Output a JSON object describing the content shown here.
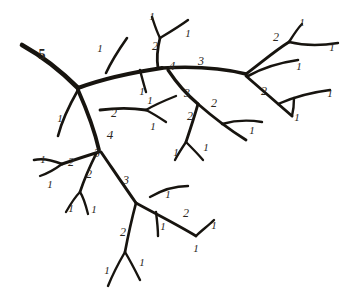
{
  "figure": {
    "kind": "branching-network",
    "background_color": "#ffffff",
    "stroke_color": "#17140f",
    "label_color": "#2a2520",
    "width": 348,
    "height": 292
  },
  "chart_data": {
    "type": "diagram",
    "title": "",
    "xlabel": "",
    "ylabel": "",
    "order_labels": [
      {
        "id": "lbl-5-trunk",
        "text": "5",
        "x": 42,
        "y": 55,
        "size": "s5"
      },
      {
        "id": "lbl-1-a",
        "text": "1",
        "x": 100,
        "y": 48,
        "size": "s2"
      },
      {
        "id": "lbl-1-b",
        "text": "1",
        "x": 152,
        "y": 16,
        "size": "s2"
      },
      {
        "id": "lbl-1-c",
        "text": "1",
        "x": 188,
        "y": 33,
        "size": "s2"
      },
      {
        "id": "lbl-2-a",
        "text": "2",
        "x": 155,
        "y": 46,
        "size": "s3"
      },
      {
        "id": "lbl-4-a",
        "text": "4",
        "x": 172,
        "y": 65,
        "size": "s4"
      },
      {
        "id": "lbl-3-a",
        "text": "3",
        "x": 201,
        "y": 61,
        "size": "s3"
      },
      {
        "id": "lbl-1-d",
        "text": "1",
        "x": 142,
        "y": 91,
        "size": "s2"
      },
      {
        "id": "lbl-1-e",
        "text": "1",
        "x": 302,
        "y": 22,
        "size": "s2"
      },
      {
        "id": "lbl-2-b",
        "text": "2",
        "x": 276,
        "y": 37,
        "size": "s3"
      },
      {
        "id": "lbl-1-f",
        "text": "1",
        "x": 332,
        "y": 47,
        "size": "s2"
      },
      {
        "id": "lbl-1-g",
        "text": "1",
        "x": 299,
        "y": 66,
        "size": "s2"
      },
      {
        "id": "lbl-2-c",
        "text": "2",
        "x": 264,
        "y": 91,
        "size": "s3"
      },
      {
        "id": "lbl-1-h",
        "text": "1",
        "x": 330,
        "y": 93,
        "size": "s2"
      },
      {
        "id": "lbl-1-i",
        "text": "1",
        "x": 297,
        "y": 117,
        "size": "s2"
      },
      {
        "id": "lbl-3-b",
        "text": "3",
        "x": 187,
        "y": 93,
        "size": "s3"
      },
      {
        "id": "lbl-2-d",
        "text": "2",
        "x": 214,
        "y": 103,
        "size": "s3"
      },
      {
        "id": "lbl-1-j",
        "text": "1",
        "x": 252,
        "y": 130,
        "size": "s2"
      },
      {
        "id": "lbl-2-e",
        "text": "2",
        "x": 190,
        "y": 116,
        "size": "s3"
      },
      {
        "id": "lbl-1-k",
        "text": "1",
        "x": 206,
        "y": 147,
        "size": "s2"
      },
      {
        "id": "lbl-1-l",
        "text": "1",
        "x": 176,
        "y": 152,
        "size": "s2"
      },
      {
        "id": "lbl-1-m",
        "text": "1",
        "x": 60,
        "y": 118,
        "size": "s2"
      },
      {
        "id": "lbl-2-f",
        "text": "2",
        "x": 114,
        "y": 113,
        "size": "s3"
      },
      {
        "id": "lbl-4-b",
        "text": "4",
        "x": 110,
        "y": 134,
        "size": "s4"
      },
      {
        "id": "lbl-1-n",
        "text": "1",
        "x": 150,
        "y": 100,
        "size": "s2"
      },
      {
        "id": "lbl-1-o",
        "text": "1",
        "x": 153,
        "y": 126,
        "size": "s2"
      },
      {
        "id": "lbl-3-c",
        "text": "3",
        "x": 97,
        "y": 153,
        "size": "s3"
      },
      {
        "id": "lbl-2-g",
        "text": "2",
        "x": 71,
        "y": 162,
        "size": "s3"
      },
      {
        "id": "lbl-1-p",
        "text": "1",
        "x": 43,
        "y": 159,
        "size": "s2"
      },
      {
        "id": "lbl-1-q",
        "text": "1",
        "x": 50,
        "y": 184,
        "size": "s2"
      },
      {
        "id": "lbl-2-h",
        "text": "2",
        "x": 89,
        "y": 174,
        "size": "s3"
      },
      {
        "id": "lbl-1-r",
        "text": "1",
        "x": 71,
        "y": 208,
        "size": "s2"
      },
      {
        "id": "lbl-1-s",
        "text": "1",
        "x": 94,
        "y": 209,
        "size": "s2"
      },
      {
        "id": "lbl-3-d",
        "text": "3",
        "x": 126,
        "y": 180,
        "size": "s3"
      },
      {
        "id": "lbl-1-t",
        "text": "1",
        "x": 168,
        "y": 194,
        "size": "s2"
      },
      {
        "id": "lbl-2-i",
        "text": "2",
        "x": 186,
        "y": 213,
        "size": "s3"
      },
      {
        "id": "lbl-1-u",
        "text": "1",
        "x": 163,
        "y": 226,
        "size": "s2"
      },
      {
        "id": "lbl-1-v",
        "text": "1",
        "x": 214,
        "y": 225,
        "size": "s2"
      },
      {
        "id": "lbl-1-w",
        "text": "1",
        "x": 196,
        "y": 248,
        "size": "s2"
      },
      {
        "id": "lbl-2-j",
        "text": "2",
        "x": 123,
        "y": 232,
        "size": "s3"
      },
      {
        "id": "lbl-1-x",
        "text": "1",
        "x": 107,
        "y": 270,
        "size": "s2"
      },
      {
        "id": "lbl-1-y",
        "text": "1",
        "x": 142,
        "y": 262,
        "size": "s2"
      }
    ],
    "segments": [
      {
        "id": "seg-trunk-5",
        "order": 5,
        "width": 4.6,
        "d": "M22,45 C40,55 60,70 78,88"
      },
      {
        "id": "seg-main-4-right",
        "order": 4,
        "width": 4.0,
        "d": "M78,88 C105,78 135,72 162,68"
      },
      {
        "id": "seg-4-to-3",
        "order": 3,
        "width": 3.4,
        "d": "M162,68 C195,66 222,68 246,74"
      },
      {
        "id": "seg-node2-stem",
        "order": 2,
        "width": 2.8,
        "d": "M158,68 C156,56 158,46 160,38"
      },
      {
        "id": "seg-2a-tipL",
        "order": 1,
        "width": 2.4,
        "d": "M160,38 C156,30 154,23 152,17"
      },
      {
        "id": "seg-2a-tipR",
        "order": 1,
        "width": 2.4,
        "d": "M160,38 C170,32 180,26 188,20"
      },
      {
        "id": "seg-1-up-left",
        "order": 1,
        "width": 2.6,
        "d": "M106,73 C112,60 120,48 127,38"
      },
      {
        "id": "seg-1-down-mid",
        "order": 1,
        "width": 2.4,
        "d": "M140,70 C142,78 144,85 146,92"
      },
      {
        "id": "seg-r-2-stem",
        "order": 2,
        "width": 2.9,
        "d": "M246,74 C262,62 276,50 289,42"
      },
      {
        "id": "seg-r-2-tip",
        "order": 1,
        "width": 2.4,
        "d": "M289,42 C294,34 298,28 302,24"
      },
      {
        "id": "seg-r-2-curve",
        "order": 1,
        "width": 2.4,
        "d": "M289,42 C305,46 320,46 338,43"
      },
      {
        "id": "seg-r-lower1",
        "order": 1,
        "width": 2.6,
        "d": "M248,76 C266,66 284,62 298,60"
      },
      {
        "id": "seg-r-2c-stem",
        "order": 2,
        "width": 2.9,
        "d": "M246,76 C262,90 278,104 292,116"
      },
      {
        "id": "seg-r-2c-curve",
        "order": 1,
        "width": 2.4,
        "d": "M278,104 C296,96 314,92 330,90"
      },
      {
        "id": "seg-r-2c-tip",
        "order": 1,
        "width": 2.4,
        "d": "M292,116 C294,108 294,103 294,98"
      },
      {
        "id": "seg-3b-down",
        "order": 3,
        "width": 3.2,
        "d": "M168,70 C176,82 186,94 198,104"
      },
      {
        "id": "seg-2d-right",
        "order": 2,
        "width": 2.8,
        "d": "M198,104 C214,118 230,130 246,140"
      },
      {
        "id": "seg-2d-curve",
        "order": 1,
        "width": 2.4,
        "d": "M222,124 C236,120 250,120 262,122"
      },
      {
        "id": "seg-2e-down",
        "order": 2,
        "width": 2.8,
        "d": "M198,104 C194,118 190,130 186,142"
      },
      {
        "id": "seg-2e-tipL",
        "order": 1,
        "width": 2.3,
        "d": "M186,142 C182,148 178,154 175,160"
      },
      {
        "id": "seg-2e-tipR",
        "order": 1,
        "width": 2.3,
        "d": "M186,142 C192,148 198,154 203,160"
      },
      {
        "id": "seg-1-fromjunc",
        "order": 1,
        "width": 2.6,
        "d": "M78,90 C70,104 62,120 58,136"
      },
      {
        "id": "seg-4b-down",
        "order": 4,
        "width": 3.8,
        "d": "M78,90 C86,108 94,128 99,150"
      },
      {
        "id": "seg-2f-right",
        "order": 2,
        "width": 2.8,
        "d": "M100,110 C116,108 132,108 146,110"
      },
      {
        "id": "seg-2f-tipU",
        "order": 1,
        "width": 2.3,
        "d": "M146,110 C156,104 166,100 176,96"
      },
      {
        "id": "seg-2f-tipD",
        "order": 1,
        "width": 2.3,
        "d": "M146,110 C154,114 160,118 166,122"
      },
      {
        "id": "seg-3c-left",
        "order": 3,
        "width": 3.0,
        "d": "M99,152 C86,156 74,160 62,164"
      },
      {
        "id": "seg-2g-curveL",
        "order": 2,
        "width": 2.6,
        "d": "M62,164 C52,160 42,158 34,160"
      },
      {
        "id": "seg-2g-tipD",
        "order": 1,
        "width": 2.3,
        "d": "M62,164 C54,170 46,174 40,176"
      },
      {
        "id": "seg-2h-down",
        "order": 2,
        "width": 2.7,
        "d": "M96,154 C90,166 84,180 80,192"
      },
      {
        "id": "seg-2h-tipL",
        "order": 1,
        "width": 2.3,
        "d": "M80,192 C74,198 70,205 66,212"
      },
      {
        "id": "seg-2h-tipR",
        "order": 1,
        "width": 2.3,
        "d": "M80,192 C84,198 86,206 88,214"
      },
      {
        "id": "seg-3d-down",
        "order": 3,
        "width": 3.0,
        "d": "M101,152 C112,168 124,186 136,203"
      },
      {
        "id": "seg-2i-right",
        "order": 2,
        "width": 2.7,
        "d": "M136,203 C156,214 176,224 196,236"
      },
      {
        "id": "seg-2i-curve",
        "order": 1,
        "width": 2.4,
        "d": "M150,197 C162,190 176,186 188,186"
      },
      {
        "id": "seg-2i-tip1",
        "order": 1,
        "width": 2.4,
        "d": "M156,212 C157,220 158,228 158,236"
      },
      {
        "id": "seg-2i-tip2",
        "order": 1,
        "width": 2.4,
        "d": "M196,236 C202,230 208,226 214,220"
      },
      {
        "id": "seg-2j-down",
        "order": 2,
        "width": 2.7,
        "d": "M136,203 C132,218 128,236 125,252"
      },
      {
        "id": "seg-2j-tipL",
        "order": 1,
        "width": 2.4,
        "d": "M125,252 C118,264 112,276 108,286"
      },
      {
        "id": "seg-2j-tipR",
        "order": 1,
        "width": 2.4,
        "d": "M125,252 C131,262 136,272 140,280"
      }
    ]
  }
}
